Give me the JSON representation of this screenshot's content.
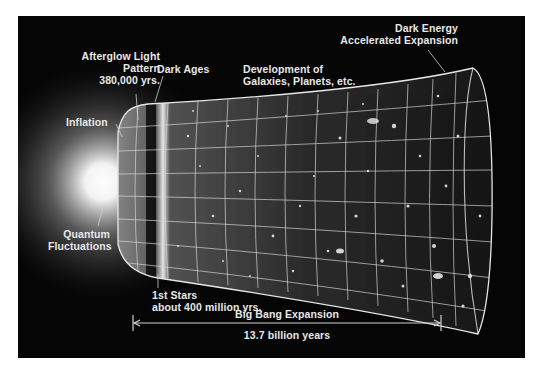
{
  "diagram": {
    "colors": {
      "background": "#050505",
      "text": "#e8e8e8",
      "grid": "#d8d8d8",
      "glow": "#ffffff"
    },
    "labels": {
      "afterglow": {
        "line1": "Afterglow Light",
        "line2": "Pattern",
        "line3": "380,000 yrs."
      },
      "dark_ages": "Dark Ages",
      "development": {
        "line1": "Development of",
        "line2": "Galaxies, Planets, etc."
      },
      "dark_energy": {
        "line1": "Dark Energy",
        "line2": "Accelerated Expansion"
      },
      "inflation": "Inflation",
      "quantum": {
        "line1": "Quantum",
        "line2": "Fluctuations"
      },
      "first_stars": {
        "line1": "1st Stars",
        "line2": "about 400 million yrs."
      },
      "expansion": "Big Bang Expansion",
      "duration": "13.7 billion years"
    }
  }
}
